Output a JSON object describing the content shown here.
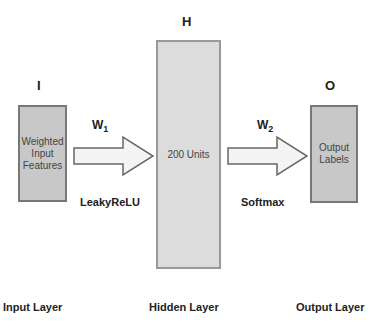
{
  "nodes": {
    "input": {
      "letter": "I",
      "label_lines": [
        "Weighted",
        "Input",
        "Features"
      ],
      "layer_label": "Input Layer"
    },
    "hidden": {
      "letter": "H",
      "label": "200 Units",
      "layer_label": "Hidden Layer"
    },
    "output": {
      "letter": "O",
      "label_lines": [
        "Output",
        "Labels"
      ],
      "layer_label": "Output Layer"
    }
  },
  "edges": [
    {
      "from": "input",
      "to": "hidden",
      "weight": "W",
      "weight_sub": "1",
      "activation": "LeakyReLU"
    },
    {
      "from": "hidden",
      "to": "output",
      "weight": "W",
      "weight_sub": "2",
      "activation": "Softmax"
    }
  ],
  "colors": {
    "box_fill": "#c8c8c8",
    "hidden_fill": "#dcdcdc",
    "border": "#777777",
    "arrow_fill": "#f4f4f4",
    "text": "#222222"
  }
}
